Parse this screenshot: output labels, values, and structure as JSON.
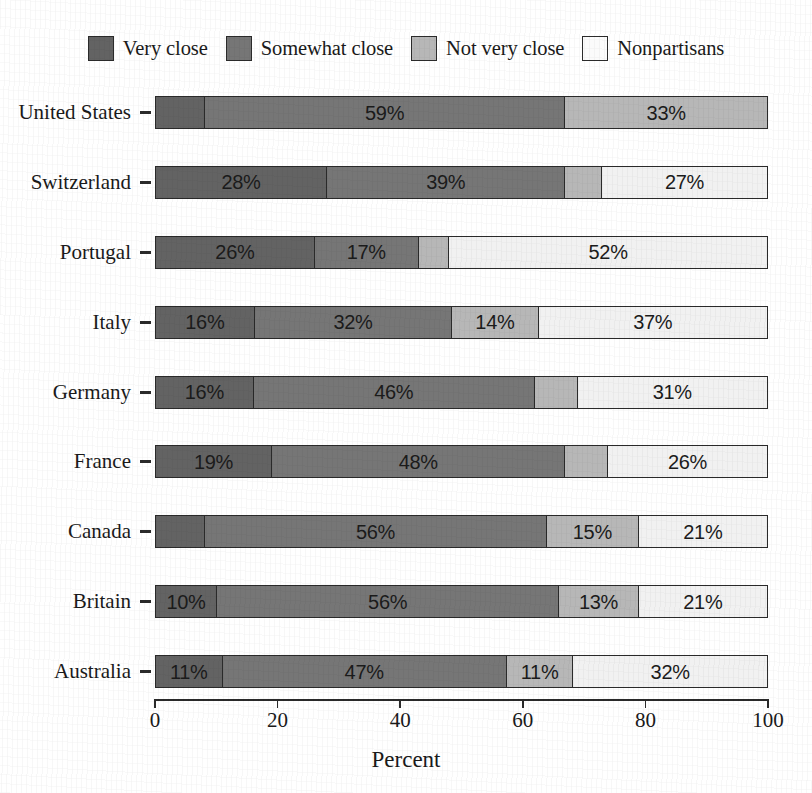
{
  "chart_data": {
    "type": "bar",
    "subtype": "stacked-horizontal-100pct",
    "title": "",
    "subtitle": "",
    "xlabel": "Percent",
    "ylabel": "",
    "xlim": [
      0,
      100
    ],
    "xticks": [
      "0",
      "20",
      "40",
      "60",
      "80",
      "100"
    ],
    "xtick_values": [
      0,
      20,
      40,
      60,
      80,
      100
    ],
    "grid": false,
    "legend_position": "top-center",
    "categories": [
      "United States",
      "Switzerland",
      "Portugal",
      "Italy",
      "Germany",
      "France",
      "Canada",
      "Britain",
      "Australia"
    ],
    "series": [
      {
        "name": "Very close",
        "color": "#636363",
        "values": [
          8,
          28,
          26,
          16,
          16,
          19,
          8,
          10,
          11
        ]
      },
      {
        "name": "Somewhat close",
        "color": "#767676",
        "values": [
          59,
          39,
          17,
          32,
          46,
          48,
          56,
          56,
          47
        ]
      },
      {
        "name": "Not very close",
        "color": "#b7b7b7",
        "values": [
          33,
          6,
          5,
          14,
          7,
          7,
          15,
          13,
          11
        ]
      },
      {
        "name": "Nonpartisans",
        "color": "#f1f1f1",
        "values": [
          0,
          27,
          52,
          37,
          31,
          26,
          21,
          21,
          32
        ]
      }
    ],
    "bar_labels": [
      [
        "",
        "59%",
        "33%",
        ""
      ],
      [
        "28%",
        "39%",
        "",
        "27%"
      ],
      [
        "26%",
        "17%",
        "",
        "52%"
      ],
      [
        "16%",
        "32%",
        "14%",
        "37%"
      ],
      [
        "16%",
        "46%",
        "",
        "31%"
      ],
      [
        "19%",
        "48%",
        "",
        "26%"
      ],
      [
        "",
        "56%",
        "15%",
        "21%"
      ],
      [
        "10%",
        "56%",
        "13%",
        "21%"
      ],
      [
        "11%",
        "47%",
        "11%",
        "32%"
      ]
    ]
  },
  "legend": {
    "items": [
      {
        "label": "Very close",
        "color": "#636363"
      },
      {
        "label": "Somewhat close",
        "color": "#767676"
      },
      {
        "label": "Not very close",
        "color": "#b7b7b7"
      },
      {
        "label": "Nonpartisans",
        "color": "#fbfbfb"
      }
    ]
  },
  "axis": {
    "x_title": "Percent",
    "x_ticks": [
      "0",
      "20",
      "40",
      "60",
      "80",
      "100"
    ],
    "y_ticks": [
      "United States",
      "Switzerland",
      "Portugal",
      "Italy",
      "Germany",
      "France",
      "Canada",
      "Britain",
      "Australia"
    ]
  }
}
